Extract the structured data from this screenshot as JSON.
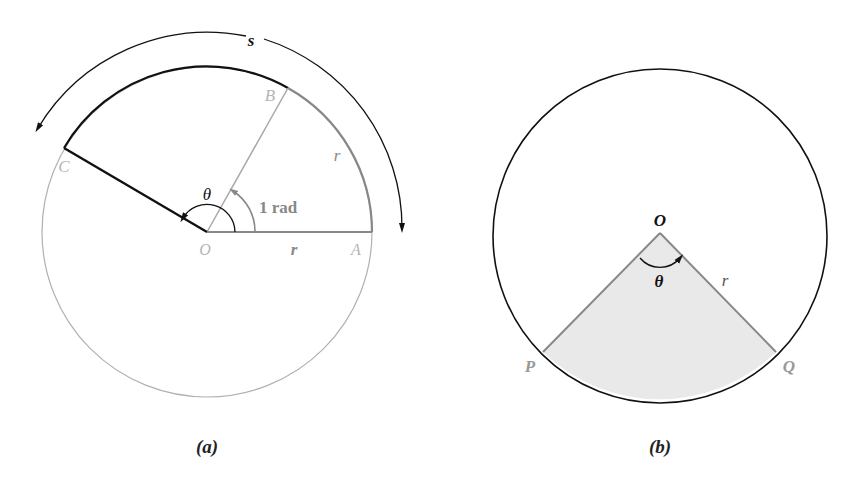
{
  "figure_a": {
    "caption": "(a)",
    "labels": {
      "arc_length": "s",
      "point_b": "B",
      "point_c": "C",
      "point_o": "O",
      "point_a": "A",
      "radius_arc": "r",
      "radius_base": "r",
      "angle_theta": "θ",
      "one_radian": "1 rad"
    }
  },
  "figure_b": {
    "caption": "(b)",
    "labels": {
      "point_o": "O",
      "point_p": "P",
      "point_q": "Q",
      "radius": "r",
      "angle_theta": "θ"
    }
  },
  "colors": {
    "dark_line": "#111111",
    "gray_line": "#8a8a8a",
    "light_gray_line": "#a8a8a8",
    "gray_text": "#8c8c8c",
    "sector_fill": "#e8e8e8"
  }
}
